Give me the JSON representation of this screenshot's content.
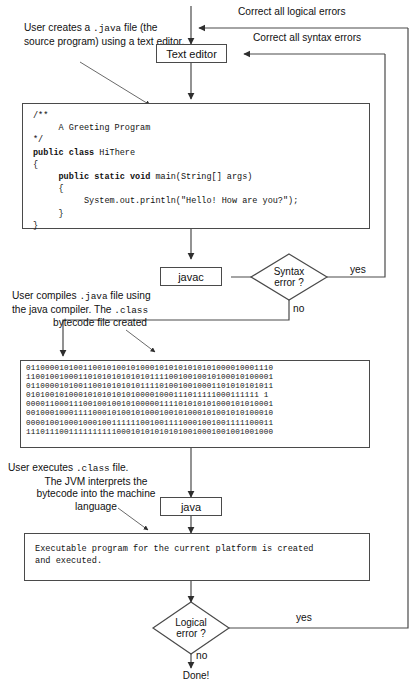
{
  "diagram": {
    "line_color": "#4a4a4a",
    "text_color": "#111111"
  },
  "notes": {
    "create": {
      "line1_a": "User creates a ",
      "line1_mono": ".java",
      "line1_b": " file (the",
      "line2": "source program) using a text editor."
    },
    "compile": {
      "line1_a": "User compiles ",
      "line1_mono": ".java",
      "line1_b": " file using",
      "line2_a": "the java compiler. The ",
      "line2_mono": ".class",
      "line3": "bytecode file created"
    },
    "execute": {
      "line1_a": "User executes ",
      "line1_mono": ".class",
      "line1_b": " file.",
      "line2": "The JVM interprets the",
      "line3": "bytecode into  the machine",
      "line4": "language"
    }
  },
  "nodes": {
    "text_editor": "Text editor",
    "javac": "javac",
    "java": "java",
    "syntax_decision_line1": "Syntax",
    "syntax_decision_line2": "error ?",
    "logical_decision_line1": "Logical",
    "logical_decision_line2": "error ?",
    "done": "Done!"
  },
  "edge_labels": {
    "correct_logical": "Correct  all logical errors",
    "correct_syntax": "Correct  all syntax errors",
    "syntax_yes": "yes",
    "syntax_no": "no",
    "logical_yes": "yes",
    "logical_no": "no"
  },
  "code": {
    "lines": [
      "/**",
      "     A Greeting Program",
      "*/",
      "public class HiThere",
      "{",
      "     public static void main(String[] args)",
      "     {",
      "          System.out.println(\"Hello! How are you?\");",
      "     }",
      "}"
    ]
  },
  "bytecode": {
    "lines": [
      "0110000101001100101001010001010101010101000010001110",
      "1100100100011010101010101011110010010010100010100001",
      "0110000101001100101010101111010010010001101010101011",
      "0101001010001010101010100001000111011111000111111 1",
      "0000110001110010010010100000111101010101000101010001",
      "0010001000111100010100101000100101000101001010100010",
      "0000100100010001001111110010011110001001001111100011",
      "1110111001111111111000101010101010010001001001001000"
    ]
  },
  "executable": {
    "line1": "Executable program for the current platform is created",
    "line2": "and executed."
  }
}
